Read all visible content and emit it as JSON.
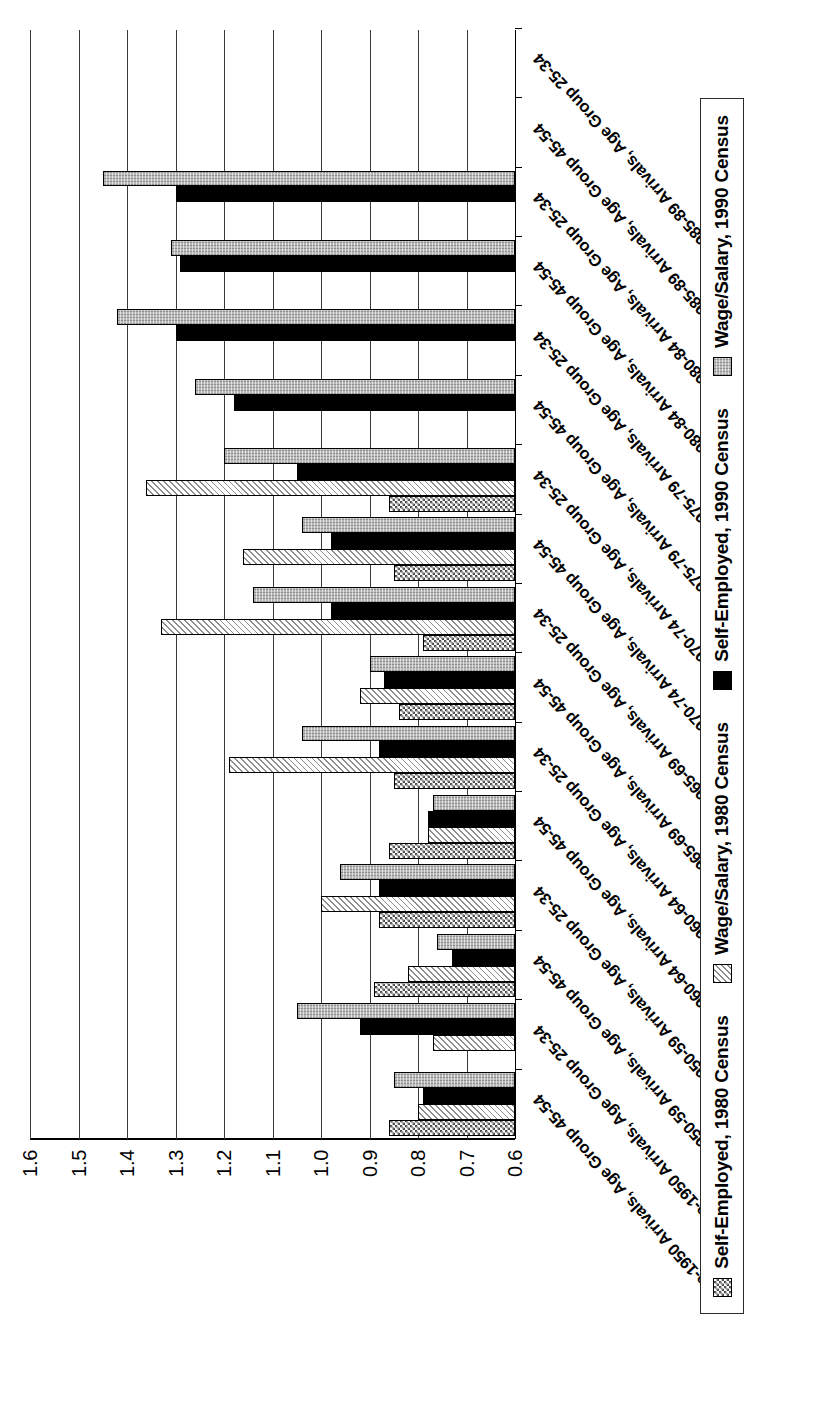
{
  "chart_data": {
    "type": "bar",
    "orientation": "vertical-rotated-90",
    "title": "",
    "xlabel": "",
    "ylabel": "",
    "ylim": [
      0.6,
      1.6
    ],
    "ytick_labels": [
      "1.6",
      "1.5",
      "1.4",
      "1.3",
      "1.2",
      "1.1",
      "1.0",
      "0.9",
      "0.8",
      "0.7",
      "0.6"
    ],
    "ytick_values": [
      1.6,
      1.5,
      1.4,
      1.3,
      1.2,
      1.1,
      1.0,
      0.9,
      0.8,
      0.7,
      0.6
    ],
    "grid": true,
    "legend_position": "bottom",
    "categories": [
      "Pre-1950 Arrivals, Age Group 45-54",
      "Pre-1950 Arrivals, Age Group 25-34",
      "1950-59 Arrivals, Age Group 45-54",
      "1950-59 Arrivals, Age Group 25-34",
      "1960-64 Arrivals, Age Group 45-54",
      "1960-64 Arrivals, Age Group 25-34",
      "1965-69 Arrivals, Age Group 45-54",
      "1965-69 Arrivals, Age Group 25-34",
      "1970-74 Arrivals, Age Group 45-54",
      "1970-74 Arrivals, Age Group 25-34",
      "1975-79 Arrivals, Age Group 45-54",
      "1975-79 Arrivals, Age Group 25-34",
      "1980-84 Arrivals, Age Group 45-54",
      "1980-84 Arrivals, Age Group 25-34",
      "1985-89 Arrivals, Age Group 45-54",
      "1985-89 Arrivals, Age Group 25-34"
    ],
    "series": [
      {
        "name": "Self-Employed, 1980 Census",
        "pattern": "checkerboard",
        "color": "#4a4a4a",
        "values": [
          0.86,
          null,
          0.89,
          0.88,
          0.86,
          0.85,
          0.84,
          0.79,
          0.85,
          0.86,
          null,
          null,
          null,
          null,
          null,
          null
        ]
      },
      {
        "name": "Wage/Salary, 1980 Census",
        "pattern": "diagonal-hatch",
        "color": "#8d8d8d",
        "values": [
          0.8,
          0.77,
          0.82,
          1.0,
          0.78,
          1.19,
          0.92,
          1.33,
          1.16,
          1.36,
          null,
          null,
          null,
          null,
          null,
          null
        ]
      },
      {
        "name": "Self-Employed, 1990 Census",
        "pattern": "solid",
        "color": "#000000",
        "values": [
          0.79,
          0.92,
          0.73,
          0.88,
          0.78,
          0.88,
          0.87,
          0.98,
          0.98,
          1.05,
          1.18,
          1.3,
          1.29,
          1.3,
          null,
          null
        ]
      },
      {
        "name": "Wage/Salary, 1990 Census",
        "pattern": "stipple-grey",
        "color": "#b9b9b9",
        "values": [
          0.85,
          1.05,
          0.76,
          0.96,
          0.77,
          1.04,
          0.9,
          1.14,
          1.04,
          1.2,
          1.26,
          1.42,
          1.31,
          1.45,
          null,
          null
        ]
      }
    ]
  },
  "legend": {
    "items": [
      {
        "label": "Self-Employed, 1980 Census",
        "swatch": "checkerboard-swatch"
      },
      {
        "label": "Wage/Salary, 1980 Census",
        "swatch": "hatch-swatch"
      },
      {
        "label": "Self-Employed, 1990 Census",
        "swatch": "black-swatch"
      },
      {
        "label": "Wage/Salary, 1990 Census",
        "swatch": "grey-swatch"
      }
    ]
  }
}
